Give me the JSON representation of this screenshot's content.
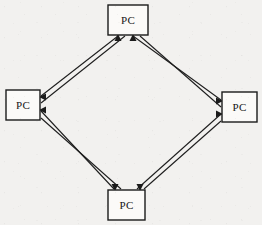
{
  "diagram": {
    "type": "network-topology",
    "canvas": {
      "width": 262,
      "height": 225
    },
    "background_color": "#f2f1ef",
    "line_color": "#1e1e1e",
    "box_fill_color": "#fbfaf8",
    "box_stroke_color": "#1b1b1b",
    "nodes": [
      {
        "id": "pc-top",
        "label": "PC",
        "position": "top",
        "x": 108,
        "y": 5,
        "w": 40,
        "h": 30,
        "label_x": 128,
        "label_y": 20
      },
      {
        "id": "pc-left",
        "label": "PC",
        "position": "left",
        "x": 6,
        "y": 90,
        "w": 34,
        "h": 30,
        "label_x": 23,
        "label_y": 105
      },
      {
        "id": "pc-right",
        "label": "PC",
        "position": "right",
        "x": 222,
        "y": 92,
        "w": 35,
        "h": 30,
        "label_x": 239,
        "label_y": 107
      },
      {
        "id": "pc-bottom",
        "label": "PC",
        "position": "bottom",
        "x": 108,
        "y": 190,
        "w": 37,
        "h": 30,
        "label_x": 126,
        "label_y": 205
      }
    ],
    "links": [
      {
        "id": "link-top-left",
        "from": "pc-left",
        "to": "pc-top",
        "style": "double-line",
        "bidirectional": true,
        "a1": {
          "x": 41,
          "y": 96
        },
        "a2": {
          "x": 118,
          "y": 36
        },
        "b1": {
          "x": 41,
          "y": 103
        },
        "b2": {
          "x": 125,
          "y": 36
        }
      },
      {
        "id": "link-top-right",
        "from": "pc-top",
        "to": "pc-right",
        "style": "double-line",
        "bidirectional": true,
        "a1": {
          "x": 133,
          "y": 36
        },
        "a2": {
          "x": 221,
          "y": 100
        },
        "b1": {
          "x": 140,
          "y": 36
        },
        "b2": {
          "x": 221,
          "y": 107
        }
      },
      {
        "id": "link-bottom-right",
        "from": "pc-bottom",
        "to": "pc-right",
        "style": "double-line",
        "bidirectional": true,
        "a1": {
          "x": 137,
          "y": 189
        },
        "a2": {
          "x": 221,
          "y": 114
        },
        "b1": {
          "x": 144,
          "y": 189
        },
        "b2": {
          "x": 221,
          "y": 121
        }
      },
      {
        "id": "link-bottom-left",
        "from": "pc-left",
        "to": "pc-bottom",
        "style": "double-line",
        "bidirectional": true,
        "a1": {
          "x": 41,
          "y": 111
        },
        "a2": {
          "x": 114,
          "y": 189
        },
        "b1": {
          "x": 41,
          "y": 118
        },
        "b2": {
          "x": 121,
          "y": 189
        }
      }
    ],
    "arrows": [
      {
        "id": "arrow-into-top-left",
        "target": "pc-top",
        "direction": "up",
        "x": 118,
        "y": 36
      },
      {
        "id": "arrow-into-top-right",
        "target": "pc-top",
        "direction": "up",
        "x": 133,
        "y": 36
      },
      {
        "id": "arrow-into-left-upper",
        "target": "pc-left",
        "direction": "left",
        "x": 41,
        "y": 99
      },
      {
        "id": "arrow-into-left-lower",
        "target": "pc-left",
        "direction": "left",
        "x": 41,
        "y": 112
      },
      {
        "id": "arrow-into-right-upper",
        "target": "pc-right",
        "direction": "right",
        "x": 221,
        "y": 103
      },
      {
        "id": "arrow-into-right-lower",
        "target": "pc-right",
        "direction": "right",
        "x": 221,
        "y": 116
      },
      {
        "id": "arrow-into-bottom-left",
        "target": "pc-bottom",
        "direction": "down",
        "x": 117,
        "y": 189
      },
      {
        "id": "arrow-into-bottom-right",
        "target": "pc-bottom",
        "direction": "down",
        "x": 140,
        "y": 189
      }
    ]
  }
}
